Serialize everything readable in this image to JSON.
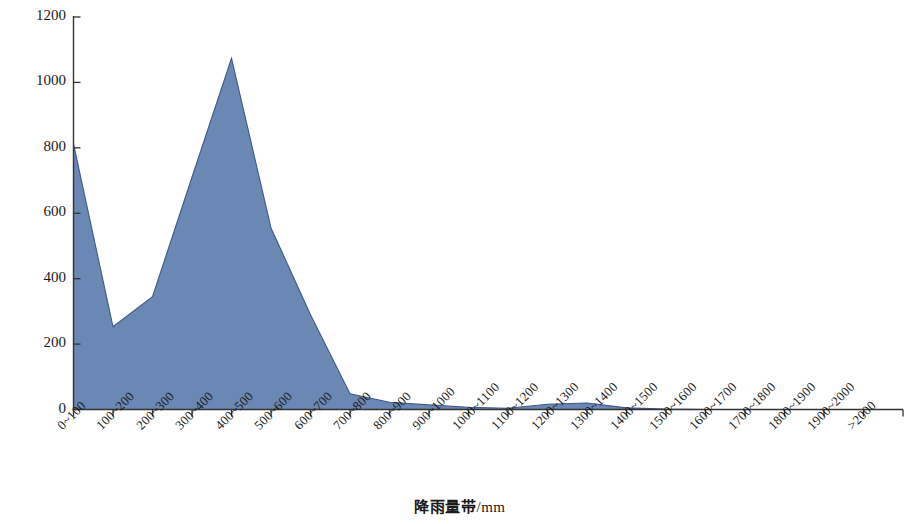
{
  "chart_data": {
    "type": "area",
    "title": "",
    "xlabel": "降雨量带/mm",
    "ylabel": "分布面积/×10⁴ hm²",
    "ylabel_parts": {
      "main": "分布面积/×10",
      "exponent": "4",
      "unit": "hm",
      "unit_exponent": "2"
    },
    "xlabel_parts": {
      "main": "降雨量带",
      "unit": "/mm"
    },
    "ylim": [
      0,
      1200
    ],
    "yticks": [
      0,
      200,
      400,
      600,
      800,
      1000,
      1200
    ],
    "ytick_labels": [
      "0",
      "200",
      "400",
      "600",
      "800",
      "1000",
      "1200"
    ],
    "grid": false,
    "legend": "none",
    "series_name": "分布面积",
    "fill_color": "#6b88b4",
    "line_color": "#3f5a86",
    "axis_color": "#333333",
    "categories": [
      "0~100",
      "100~200",
      "200~300",
      "300~400",
      "400~500",
      "500~600",
      "600~700",
      "700~800",
      "800~900",
      "900~1000",
      "1000~1100",
      "1100~1200",
      "1200~1300",
      "1300~1400",
      "1400~1500",
      "1500~1600",
      "1600~1700",
      "1700~1800",
      "1800~1900",
      "1900~2000",
      ">2000"
    ],
    "values": [
      812,
      253,
      345,
      710,
      1074,
      555,
      290,
      48,
      22,
      14,
      7,
      4,
      16,
      20,
      5,
      1,
      0,
      0,
      0,
      0,
      0
    ]
  }
}
